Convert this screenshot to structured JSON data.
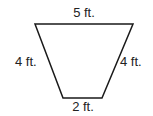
{
  "diagram": {
    "shape": "trapezoid",
    "labels": {
      "top": "5 ft.",
      "left": "4 ft.",
      "right": "4 ft.",
      "bottom": "2 ft."
    },
    "stroke_color": "#1a1a1a"
  }
}
